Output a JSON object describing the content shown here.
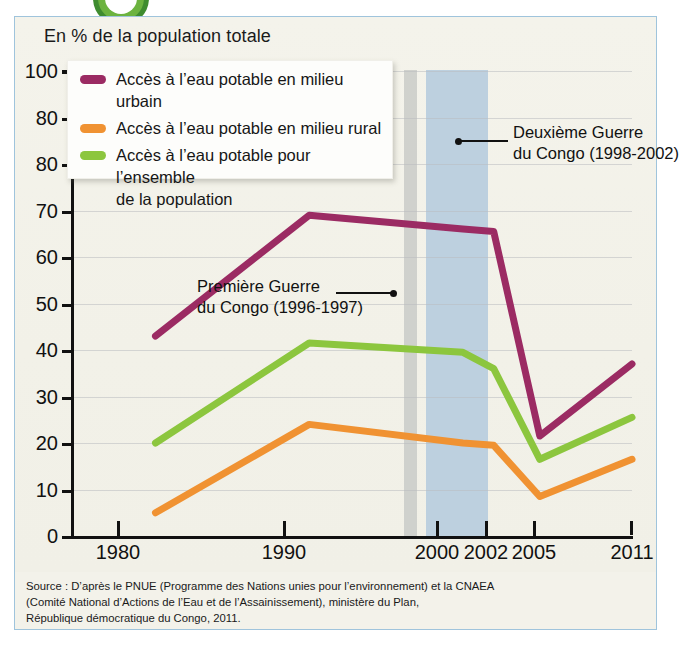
{
  "chart_data": {
    "type": "line",
    "title": "En % de la population totale",
    "xlabel": "",
    "ylabel": "En % de la population totale",
    "x": [
      1980,
      1990,
      2000,
      2002,
      2005,
      2011
    ],
    "xtick_labels": [
      "1980",
      "1990",
      "2000",
      "2002",
      "2005",
      "2011"
    ],
    "ytick_labels": [
      "100",
      "80",
      "80",
      "70",
      "60",
      "50",
      "40",
      "30",
      "20",
      "10",
      "0"
    ],
    "ytick_values": [
      100,
      90,
      80,
      70,
      60,
      50,
      40,
      30,
      20,
      10,
      0
    ],
    "ylim": [
      0,
      100
    ],
    "grid": true,
    "legend_position": "top-left",
    "series": [
      {
        "name": "Accès à l’eau potable en milieu urbain",
        "color": "#9b2b63",
        "values": [
          43,
          69,
          66,
          65.5,
          21.5,
          37
        ]
      },
      {
        "name": "Accès à l’eau potable en milieu rural",
        "color": "#f09232",
        "values": [
          5,
          24,
          20,
          19.5,
          8.5,
          16.5
        ]
      },
      {
        "name": "Accès à l’eau potable pour l’ensemble de la population",
        "color": "#8cc63e",
        "values": [
          20,
          41.5,
          39.5,
          36,
          16.5,
          25.5
        ]
      }
    ],
    "annotations": [
      {
        "id": "premiere-guerre",
        "line1": "Première Guerre",
        "line2": "du Congo (1996-1997)",
        "band_years": [
          1996,
          1997
        ],
        "band_color": "#c9cbc8"
      },
      {
        "id": "deuxieme-guerre",
        "line1": "Deuxième Guerre",
        "line2": "du Congo (1998-2002)",
        "band_years": [
          1998,
          2002
        ],
        "band_color": "#b9cede"
      }
    ]
  },
  "legend": {
    "items": [
      {
        "label_line1": "Accès à l’eau potable en milieu urbain",
        "label_line2": "",
        "color": "#9b2b63"
      },
      {
        "label_line1": "Accès à l’eau potable en milieu rural",
        "label_line2": "",
        "color": "#f09232"
      },
      {
        "label_line1": "Accès à l’eau potable pour l’ensemble",
        "label_line2": "de la population",
        "color": "#8cc63e"
      }
    ]
  },
  "source": {
    "line1": "Source : D’après le PNUE (Programme des Nations unies pour l’environnement) et la CNAEA",
    "line2": "(Comité National d’Actions de l’Eau et de l’Assainissement), ministère du Plan,",
    "line3": "République démocratique du Congo, 2011."
  },
  "colors": {
    "urban": "#9b2b63",
    "rural": "#f09232",
    "ensemble": "#8cc63e",
    "band_first_war": "#c9cbc8",
    "band_second_war": "#b9cede",
    "frame_border": "#9fc4dc",
    "paper": "#f3f2ea",
    "badge": "#6cb33f"
  }
}
